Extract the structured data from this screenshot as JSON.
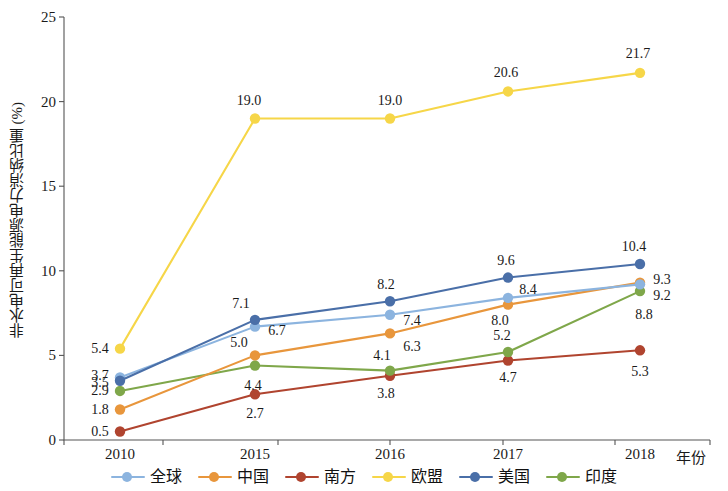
{
  "axes": {
    "y_title": "非水电可再生能源电力消纳比重 (%)",
    "x_title": "年份",
    "y_ticks": [
      "0",
      "5",
      "10",
      "15",
      "20",
      "25"
    ],
    "x_ticks": [
      "2010",
      "2015",
      "2016",
      "2017",
      "2018"
    ]
  },
  "legend": {
    "items": [
      {
        "label": "全球",
        "color": "#8CB4DF"
      },
      {
        "label": "中国",
        "color": "#E8963C"
      },
      {
        "label": "南方",
        "color": "#B0442F"
      },
      {
        "label": "欧盟",
        "color": "#F6D648"
      },
      {
        "label": "美国",
        "color": "#4A6FA8"
      },
      {
        "label": "印度",
        "color": "#7FA74A"
      }
    ]
  },
  "chart_data": {
    "type": "line",
    "title": "",
    "xlabel": "年份",
    "ylabel": "非水电可再生能源电力消纳比重 (%)",
    "categories": [
      "2010",
      "2015",
      "2016",
      "2017",
      "2018"
    ],
    "ylim": [
      0,
      25
    ],
    "ytick_step": 5,
    "grid": false,
    "legend_position": "bottom",
    "series": [
      {
        "name": "全球",
        "color": "#8CB4DF",
        "values": [
          3.7,
          6.7,
          7.4,
          8.4,
          9.2
        ]
      },
      {
        "name": "中国",
        "color": "#E8963C",
        "values": [
          1.8,
          5.0,
          6.3,
          8.0,
          9.3
        ]
      },
      {
        "name": "南方",
        "color": "#B0442F",
        "values": [
          0.5,
          2.7,
          3.8,
          4.7,
          5.3
        ]
      },
      {
        "name": "欧盟",
        "color": "#F6D648",
        "values": [
          5.4,
          19.0,
          19.0,
          20.6,
          21.7
        ]
      },
      {
        "name": "美国",
        "color": "#4A6FA8",
        "values": [
          3.5,
          7.1,
          8.2,
          9.6,
          10.4
        ]
      },
      {
        "name": "印度",
        "color": "#7FA74A",
        "values": [
          2.9,
          4.4,
          4.1,
          5.2,
          8.8
        ]
      }
    ],
    "data_labels": [
      {
        "text": "5.4",
        "series": "欧盟",
        "x_index": 0,
        "dx": -20,
        "dy": 0
      },
      {
        "text": "3.7",
        "series": "全球",
        "x_index": 0,
        "dx": -20,
        "dy": -1
      },
      {
        "text": "3.5",
        "series": "美国",
        "x_index": 0,
        "dx": -20,
        "dy": 2
      },
      {
        "text": "2.9",
        "series": "印度",
        "x_index": 0,
        "dx": -20,
        "dy": 0
      },
      {
        "text": "1.8",
        "series": "中国",
        "x_index": 0,
        "dx": -20,
        "dy": 0
      },
      {
        "text": "0.5",
        "series": "南方",
        "x_index": 0,
        "dx": -20,
        "dy": 0
      },
      {
        "text": "7.1",
        "series": "美国",
        "x_index": 1,
        "dx": -14,
        "dy": -16
      },
      {
        "text": "6.7",
        "series": "全球",
        "x_index": 1,
        "dx": 22,
        "dy": 4
      },
      {
        "text": "5.0",
        "series": "中国",
        "x_index": 1,
        "dx": -16,
        "dy": -12
      },
      {
        "text": "4.4",
        "series": "印度",
        "x_index": 1,
        "dx": -2,
        "dy": 20
      },
      {
        "text": "2.7",
        "series": "南方",
        "x_index": 1,
        "dx": 0,
        "dy": 20
      },
      {
        "text": "19.0",
        "series": "欧盟",
        "x_index": 1,
        "dx": -6,
        "dy": -18
      },
      {
        "text": "8.2",
        "series": "美国",
        "x_index": 2,
        "dx": -4,
        "dy": -16
      },
      {
        "text": "7.4",
        "series": "全球",
        "x_index": 2,
        "dx": 22,
        "dy": 6
      },
      {
        "text": "6.3",
        "series": "中国",
        "x_index": 2,
        "dx": 22,
        "dy": 14
      },
      {
        "text": "4.1",
        "series": "印度",
        "x_index": 2,
        "dx": -8,
        "dy": -15
      },
      {
        "text": "3.8",
        "series": "南方",
        "x_index": 2,
        "dx": -4,
        "dy": 18
      },
      {
        "text": "19.0",
        "series": "欧盟",
        "x_index": 2,
        "dx": 0,
        "dy": -18
      },
      {
        "text": "9.6",
        "series": "美国",
        "x_index": 3,
        "dx": -2,
        "dy": -17
      },
      {
        "text": "8.4",
        "series": "全球",
        "x_index": 3,
        "dx": 20,
        "dy": -8
      },
      {
        "text": "8.0",
        "series": "中国",
        "x_index": 3,
        "dx": -8,
        "dy": 16
      },
      {
        "text": "5.2",
        "series": "印度",
        "x_index": 3,
        "dx": -6,
        "dy": -16
      },
      {
        "text": "4.7",
        "series": "南方",
        "x_index": 3,
        "dx": 0,
        "dy": 18
      },
      {
        "text": "20.6",
        "series": "欧盟",
        "x_index": 3,
        "dx": -2,
        "dy": -18
      },
      {
        "text": "10.4",
        "series": "美国",
        "x_index": 4,
        "dx": -6,
        "dy": -17
      },
      {
        "text": "9.3",
        "series": "中国",
        "x_index": 4,
        "dx": 22,
        "dy": -3
      },
      {
        "text": "9.2",
        "series": "全球",
        "x_index": 4,
        "dx": 22,
        "dy": 12
      },
      {
        "text": "8.8",
        "series": "印度",
        "x_index": 4,
        "dx": 4,
        "dy": 24
      },
      {
        "text": "5.3",
        "series": "南方",
        "x_index": 4,
        "dx": 0,
        "dy": 22
      },
      {
        "text": "21.7",
        "series": "欧盟",
        "x_index": 4,
        "dx": -2,
        "dy": -19
      }
    ]
  }
}
